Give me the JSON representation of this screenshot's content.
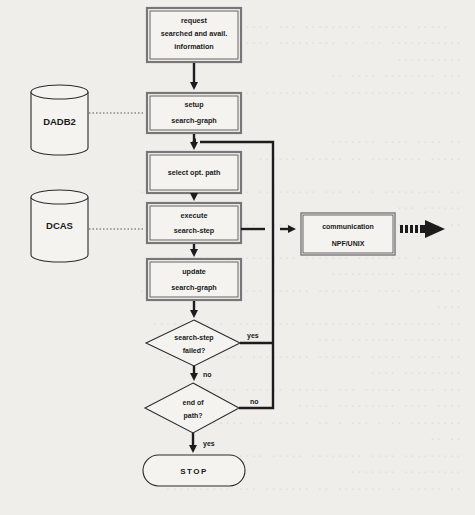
{
  "diagram": {
    "type": "flowchart",
    "processes": [
      {
        "id": "request",
        "lines": [
          "request",
          "searched and avail.",
          "information"
        ]
      },
      {
        "id": "setup",
        "lines": [
          "setup",
          "search-graph"
        ]
      },
      {
        "id": "select",
        "lines": [
          "select opt. path"
        ]
      },
      {
        "id": "execute",
        "lines": [
          "execute",
          "search-step"
        ]
      },
      {
        "id": "update",
        "lines": [
          "update",
          "search-graph"
        ]
      }
    ],
    "decisions": [
      {
        "id": "failed",
        "lines": [
          "search-step",
          "failed?"
        ],
        "yes_label": "yes",
        "no_label": "no"
      },
      {
        "id": "end",
        "lines": [
          "end of",
          "path?"
        ],
        "yes_label": "yes",
        "no_label": "no"
      }
    ],
    "terminal": {
      "label": "STOP"
    },
    "databases": [
      {
        "id": "dadb2",
        "label": "DADB2"
      },
      {
        "id": "dcas",
        "label": "DCAS"
      }
    ],
    "external": {
      "lines": [
        "communication",
        "NPF/UNIX"
      ]
    }
  }
}
